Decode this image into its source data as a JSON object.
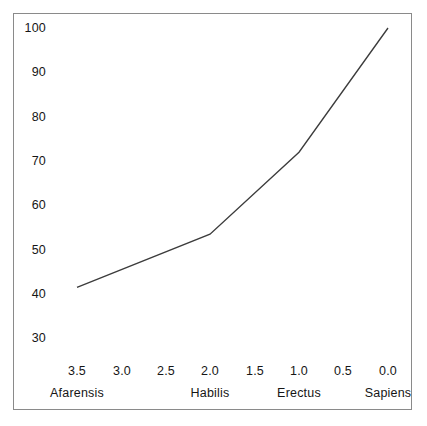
{
  "chart_data": {
    "type": "line",
    "title": "",
    "subtitle": "",
    "xlabel": "",
    "ylabel": "",
    "xlim": [
      3.75,
      -0.25
    ],
    "ylim": [
      22,
      102
    ],
    "x_axis_inverted": true,
    "grid": false,
    "legend": null,
    "x_tick_labels": [
      "3.5",
      "3.0",
      "2.5",
      "2.0",
      "1.5",
      "1.0",
      "0.5",
      "0.0"
    ],
    "x_tick_values": [
      3.5,
      3.0,
      2.5,
      2.0,
      1.5,
      1.0,
      0.5,
      0.0
    ],
    "y_tick_labels": [
      "100",
      "90",
      "80",
      "70",
      "60",
      "50",
      "40",
      "30"
    ],
    "y_tick_values": [
      100,
      90,
      80,
      70,
      60,
      50,
      40,
      30
    ],
    "category_labels": [
      {
        "name": "Afarensis",
        "x": 3.5
      },
      {
        "name": "Habilis",
        "x": 2.0
      },
      {
        "name": "Erectus",
        "x": 1.0
      },
      {
        "name": "Sapiens",
        "x": 0.0
      }
    ],
    "series": [
      {
        "name": "brain size index",
        "color": "#3c3c3c",
        "x": [
          3.5,
          2.0,
          1.0,
          0.0
        ],
        "values": [
          41.5,
          53.5,
          72.0,
          100.0
        ],
        "points": [
          {
            "x": 3.5,
            "y": 41.5,
            "label": "Afarensis"
          },
          {
            "x": 2.0,
            "y": 53.5,
            "label": "Habilis"
          },
          {
            "x": 1.0,
            "y": 72.0,
            "label": "Erectus"
          },
          {
            "x": 0.0,
            "y": 100.0,
            "label": "Sapiens"
          }
        ]
      }
    ]
  },
  "figure": {
    "background_color": "#ffffff",
    "frame_color": "#8a8a8a",
    "line_color": "#3c3c3c",
    "text_color": "#161616"
  },
  "ytick_layout": [
    {
      "label": "100",
      "top": 21
    },
    {
      "label": "90",
      "top": 65
    },
    {
      "label": "80",
      "top": 110
    },
    {
      "label": "70",
      "top": 154
    },
    {
      "label": "60",
      "top": 198
    },
    {
      "label": "50",
      "top": 243
    },
    {
      "label": "40",
      "top": 287
    },
    {
      "label": "30",
      "top": 331
    }
  ],
  "xtick_layout": [
    {
      "label": "3.5",
      "left": 77
    },
    {
      "label": "3.0",
      "left": 122
    },
    {
      "label": "2.5",
      "left": 166
    },
    {
      "label": "2.0",
      "left": 210
    },
    {
      "label": "1.5",
      "left": 255
    },
    {
      "label": "1.0",
      "left": 299
    },
    {
      "label": "0.5",
      "left": 343
    },
    {
      "label": "0.0",
      "left": 388
    }
  ],
  "xcat_layout": [
    {
      "label": "Afarensis",
      "left": 77
    },
    {
      "label": "Habilis",
      "left": 210
    },
    {
      "label": "Erectus",
      "left": 299
    },
    {
      "label": "Sapiens",
      "left": 388
    }
  ]
}
